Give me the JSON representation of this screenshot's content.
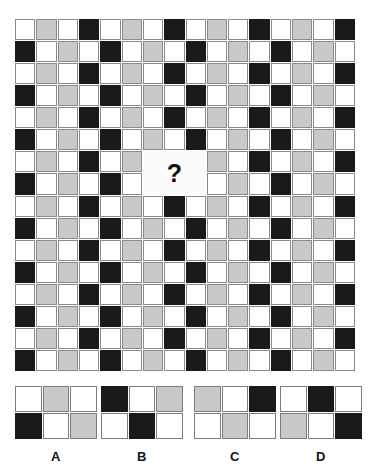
{
  "puzzle": {
    "title": "Pattern Matrix Completion Puzzle",
    "question_symbol": "?",
    "colors": {
      "white": "#ffffff",
      "gray": "#c9c9c9",
      "black": "#1a1a1a",
      "gridline": "#8a8a8a",
      "background": "#ffffff"
    },
    "matrix": {
      "columns": 16,
      "rows": 16,
      "legend": {
        "w": "white",
        "g": "gray",
        "b": "black"
      },
      "blank_region": {
        "start_col": 6,
        "start_row": 6,
        "col_span": 3,
        "row_span": 2
      },
      "cells": [
        [
          "w",
          "g",
          "w",
          "b",
          "w",
          "g",
          "w",
          "b",
          "w",
          "g",
          "w",
          "b",
          "w",
          "g",
          "w",
          "b"
        ],
        [
          "b",
          "w",
          "g",
          "w",
          "b",
          "w",
          "g",
          "w",
          "b",
          "w",
          "g",
          "w",
          "b",
          "w",
          "g",
          "w"
        ],
        [
          "w",
          "g",
          "w",
          "b",
          "w",
          "g",
          "w",
          "b",
          "w",
          "g",
          "w",
          "b",
          "w",
          "g",
          "w",
          "b"
        ],
        [
          "b",
          "w",
          "g",
          "w",
          "b",
          "w",
          "g",
          "w",
          "b",
          "w",
          "g",
          "w",
          "b",
          "w",
          "g",
          "w"
        ],
        [
          "w",
          "g",
          "w",
          "b",
          "w",
          "g",
          "w",
          "b",
          "w",
          "g",
          "w",
          "b",
          "w",
          "g",
          "w",
          "b"
        ],
        [
          "b",
          "w",
          "g",
          "w",
          "b",
          "w",
          "g",
          "w",
          "b",
          "w",
          "g",
          "w",
          "b",
          "w",
          "g",
          "w"
        ],
        [
          "w",
          "g",
          "w",
          "b",
          "w",
          "g",
          "w",
          "b",
          "w",
          "g",
          "w",
          "b",
          "w",
          "g",
          "w",
          "b"
        ],
        [
          "b",
          "w",
          "g",
          "w",
          "b",
          "w",
          "g",
          "w",
          "b",
          "w",
          "g",
          "w",
          "b",
          "w",
          "g",
          "w"
        ],
        [
          "w",
          "g",
          "w",
          "b",
          "w",
          "g",
          "w",
          "b",
          "w",
          "g",
          "w",
          "b",
          "w",
          "g",
          "w",
          "b"
        ],
        [
          "b",
          "w",
          "g",
          "w",
          "b",
          "w",
          "g",
          "w",
          "b",
          "w",
          "g",
          "w",
          "b",
          "w",
          "g",
          "w"
        ],
        [
          "w",
          "g",
          "w",
          "b",
          "w",
          "g",
          "w",
          "b",
          "w",
          "g",
          "w",
          "b",
          "w",
          "g",
          "w",
          "b"
        ],
        [
          "b",
          "w",
          "g",
          "w",
          "b",
          "w",
          "g",
          "w",
          "b",
          "w",
          "g",
          "w",
          "b",
          "w",
          "g",
          "w"
        ],
        [
          "w",
          "g",
          "w",
          "b",
          "w",
          "g",
          "w",
          "b",
          "w",
          "g",
          "w",
          "b",
          "w",
          "g",
          "w",
          "b"
        ],
        [
          "b",
          "w",
          "g",
          "w",
          "b",
          "w",
          "g",
          "w",
          "b",
          "w",
          "g",
          "w",
          "b",
          "w",
          "g",
          "w"
        ],
        [
          "w",
          "g",
          "w",
          "b",
          "w",
          "g",
          "w",
          "b",
          "w",
          "g",
          "w",
          "b",
          "w",
          "g",
          "w",
          "b"
        ],
        [
          "b",
          "w",
          "g",
          "w",
          "b",
          "w",
          "g",
          "w",
          "b",
          "w",
          "g",
          "w",
          "b",
          "w",
          "g",
          "w"
        ]
      ]
    },
    "options": [
      {
        "label": "A",
        "cells": [
          [
            "w",
            "g",
            "w"
          ],
          [
            "b",
            "w",
            "g"
          ]
        ]
      },
      {
        "label": "B",
        "cells": [
          [
            "b",
            "w",
            "g"
          ],
          [
            "w",
            "b",
            "w"
          ]
        ]
      },
      {
        "label": "C",
        "cells": [
          [
            "g",
            "w",
            "b"
          ],
          [
            "w",
            "g",
            "w"
          ]
        ]
      },
      {
        "label": "D",
        "cells": [
          [
            "w",
            "b",
            "w"
          ],
          [
            "g",
            "w",
            "b"
          ]
        ]
      }
    ]
  }
}
